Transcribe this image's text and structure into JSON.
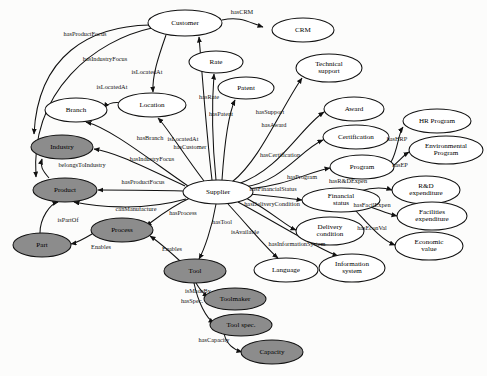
{
  "diagram": {
    "type": "ontology-graph",
    "colors": {
      "node_fill_light": "#ffffff",
      "node_fill_dark": "#8c8c8c",
      "stroke": "#111111",
      "background": "#fcfcfb",
      "label": "#000000"
    },
    "nodes": [
      {
        "id": "customer",
        "label": "Customer",
        "x": 185,
        "y": 23,
        "rx": 37,
        "ry": 13,
        "shade": "light"
      },
      {
        "id": "crm",
        "label": "CRM",
        "x": 303,
        "y": 30,
        "rx": 31,
        "ry": 12,
        "shade": "light"
      },
      {
        "id": "rate",
        "label": "Rate",
        "x": 216,
        "y": 62,
        "rx": 27,
        "ry": 11,
        "shade": "light"
      },
      {
        "id": "technical-support",
        "label": "Technical support",
        "x": 329,
        "y": 68,
        "rx": 33,
        "ry": 14,
        "shade": "light"
      },
      {
        "id": "patent",
        "label": "Patent",
        "x": 246,
        "y": 88,
        "rx": 28,
        "ry": 11,
        "shade": "light"
      },
      {
        "id": "location",
        "label": "Location",
        "x": 152,
        "y": 105,
        "rx": 34,
        "ry": 12,
        "shade": "light"
      },
      {
        "id": "branch",
        "label": "Branch",
        "x": 76,
        "y": 110,
        "rx": 31,
        "ry": 12,
        "shade": "light"
      },
      {
        "id": "award",
        "label": "Award",
        "x": 354,
        "y": 109,
        "rx": 30,
        "ry": 12,
        "shade": "light"
      },
      {
        "id": "hr-program",
        "label": "HR Program",
        "x": 437,
        "y": 121,
        "rx": 34,
        "ry": 12,
        "shade": "light"
      },
      {
        "id": "certification",
        "label": "Certification",
        "x": 356,
        "y": 137,
        "rx": 33,
        "ry": 12,
        "shade": "light"
      },
      {
        "id": "industry",
        "label": "Industry",
        "x": 62,
        "y": 147,
        "rx": 31,
        "ry": 12,
        "shade": "dark"
      },
      {
        "id": "environmental-program",
        "label": "Environmental Program",
        "x": 446,
        "y": 150,
        "rx": 37,
        "ry": 14,
        "shade": "light"
      },
      {
        "id": "program",
        "label": "Program",
        "x": 362,
        "y": 167,
        "rx": 32,
        "ry": 12,
        "shade": "light"
      },
      {
        "id": "product",
        "label": "Product",
        "x": 65,
        "y": 190,
        "rx": 32,
        "ry": 12,
        "shade": "dark"
      },
      {
        "id": "rd-expenditure",
        "label": "R&D expenditure",
        "x": 426,
        "y": 190,
        "rx": 34,
        "ry": 14,
        "shade": "light"
      },
      {
        "id": "financial-status",
        "label": "Financial status",
        "x": 341,
        "y": 200,
        "rx": 39,
        "ry": 12,
        "shade": "light"
      },
      {
        "id": "supplier",
        "label": "Supplier",
        "x": 218,
        "y": 192,
        "rx": 35,
        "ry": 12,
        "shade": "light"
      },
      {
        "id": "facilities-expenditure",
        "label": "Facilities expenditure",
        "x": 432,
        "y": 216,
        "rx": 35,
        "ry": 14,
        "shade": "light"
      },
      {
        "id": "process",
        "label": "Process",
        "x": 122,
        "y": 230,
        "rx": 31,
        "ry": 12,
        "shade": "dark"
      },
      {
        "id": "delivery-condition",
        "label": "Delivery condition",
        "x": 330,
        "y": 231,
        "rx": 34,
        "ry": 14,
        "shade": "light"
      },
      {
        "id": "economic-value",
        "label": "Economic value",
        "x": 429,
        "y": 246,
        "rx": 34,
        "ry": 14,
        "shade": "light"
      },
      {
        "id": "part",
        "label": "Part",
        "x": 42,
        "y": 245,
        "rx": 29,
        "ry": 12,
        "shade": "dark"
      },
      {
        "id": "language",
        "label": "Language",
        "x": 286,
        "y": 270,
        "rx": 32,
        "ry": 12,
        "shade": "light"
      },
      {
        "id": "information-system",
        "label": "Information system",
        "x": 352,
        "y": 268,
        "rx": 33,
        "ry": 14,
        "shade": "light"
      },
      {
        "id": "tool",
        "label": "Tool",
        "x": 195,
        "y": 271,
        "rx": 31,
        "ry": 12,
        "shade": "dark"
      },
      {
        "id": "toolmaker",
        "label": "Toolmaker",
        "x": 235,
        "y": 299,
        "rx": 31,
        "ry": 11,
        "shade": "dark"
      },
      {
        "id": "tool-spec",
        "label": "Tool spec.",
        "x": 241,
        "y": 325,
        "rx": 31,
        "ry": 11,
        "shade": "dark"
      },
      {
        "id": "capacity",
        "label": "Capacity",
        "x": 272,
        "y": 352,
        "rx": 31,
        "ry": 12,
        "shade": "dark"
      }
    ],
    "edges": [
      {
        "id": "e-hascrm",
        "label": "hasCRM",
        "from": "customer",
        "to": "crm",
        "path": "M 222 20 C 240 16 248 22 263 27",
        "label_x": 242,
        "label_y": 13
      },
      {
        "id": "e-hasproductfocus-cust",
        "label": "hasProductFocus",
        "from": "customer",
        "to": "industry",
        "path": "M 150 25 C 90 26 38 55 34 134",
        "label_x": 85,
        "label_y": 35
      },
      {
        "id": "e-hasindustryfocus-cust",
        "label": "hasIndustryFocus",
        "from": "customer",
        "to": "product",
        "path": "M 152 28 C 96 40 30 90 36 177",
        "label_x": 105,
        "label_y": 60
      },
      {
        "id": "e-islocatedat-cust",
        "label": "isLocatedAt",
        "from": "customer",
        "to": "location",
        "path": "M 166 35 C 158 58 152 76 153 92",
        "label_x": 147,
        "label_y": 73
      },
      {
        "id": "e-islocatedat-branch",
        "label": "isLocatedAt",
        "from": "location",
        "to": "branch",
        "path": "M 122 103 C 112 101 106 105 104 108",
        "label_x": 112,
        "label_y": 88
      },
      {
        "id": "e-hasbranch",
        "label": "hasBranch",
        "from": "supplier",
        "to": "branch",
        "path": "M 188 186 C 150 160 110 128 86 122",
        "label_x": 150,
        "label_y": 139
      },
      {
        "id": "e-hasindustryfocus-sup",
        "label": "hasIndustryFocus",
        "from": "supplier",
        "to": "industry",
        "path": "M 185 186 C 150 170 116 152 94 149",
        "label_x": 152,
        "label_y": 160
      },
      {
        "id": "e-hasproductfocus-sup",
        "label": "hasProductFocus",
        "from": "supplier",
        "to": "product",
        "path": "M 183 191 C 150 190 120 190 98 190",
        "label_x": 143,
        "label_y": 183
      },
      {
        "id": "e-belongstoindustry",
        "label": "belongsToIndustry",
        "from": "product",
        "to": "industry",
        "path": "M 49 178 C 42 170 40 166 42 159",
        "label_x": 82,
        "label_y": 166
      },
      {
        "id": "e-islocatedat-sup",
        "label": "isLocatedAt",
        "from": "supplier",
        "to": "location",
        "path": "M 204 181 C 184 155 166 126 158 118",
        "label_x": 183,
        "label_y": 140
      },
      {
        "id": "e-hascustomer",
        "label": "hasCustomer",
        "from": "supplier",
        "to": "customer",
        "path": "M 212 180 C 206 130 202 70 199 37",
        "label_x": 190,
        "label_y": 148
      },
      {
        "id": "e-hasrate",
        "label": "hasRate",
        "from": "supplier",
        "to": "rate",
        "path": "M 216 180 C 212 140 212 100 214 74",
        "label_x": 209,
        "label_y": 98
      },
      {
        "id": "e-haspatent",
        "label": "hasPatent",
        "from": "supplier",
        "to": "patent",
        "path": "M 222 180 C 224 150 228 115 235 100",
        "label_x": 221,
        "label_y": 115
      },
      {
        "id": "e-hassupport",
        "label": "hasSupport",
        "from": "supplier",
        "to": "technical-support",
        "path": "M 232 182 C 260 160 280 110 302 78",
        "label_x": 270,
        "label_y": 113
      },
      {
        "id": "e-hasaward",
        "label": "hasAward",
        "from": "supplier",
        "to": "award",
        "path": "M 238 184 C 280 170 300 128 324 112",
        "label_x": 274,
        "label_y": 126
      },
      {
        "id": "e-hascertification",
        "label": "hasCertification",
        "from": "supplier",
        "to": "certification",
        "path": "M 244 187 C 282 182 300 150 323 140",
        "label_x": 280,
        "label_y": 156
      },
      {
        "id": "e-hasprogram",
        "label": "hasProgram",
        "from": "supplier",
        "to": "program",
        "path": "M 248 189 C 286 186 308 172 330 168",
        "label_x": 302,
        "label_y": 178
      },
      {
        "id": "e-hashrp",
        "label": "hasHRP",
        "from": "program",
        "to": "hr-program",
        "path": "M 391 162 C 398 150 398 134 403 127",
        "label_x": 397,
        "label_y": 140
      },
      {
        "id": "e-hasep",
        "label": "hasEP",
        "from": "program",
        "to": "environmental-program",
        "path": "M 393 166 C 400 160 404 155 409 152",
        "label_x": 400,
        "label_y": 166
      },
      {
        "id": "e-hasfinancialstatus",
        "label": "hasFinancialStatus",
        "from": "supplier",
        "to": "financial-status",
        "path": "M 249 194 C 275 196 290 199 302 200",
        "label_x": 273,
        "label_y": 190
      },
      {
        "id": "e-hasrdexpen",
        "label": "hasR&DExpen",
        "from": "financial-status",
        "to": "rd-expenditure",
        "path": "M 360 191 C 376 186 386 188 392 190",
        "label_x": 348,
        "label_y": 182
      },
      {
        "id": "e-hasfacilexpen",
        "label": "hasFacilExpen",
        "from": "financial-status",
        "to": "facilities-expenditure",
        "path": "M 368 206 C 382 211 388 214 397 216",
        "label_x": 372,
        "label_y": 206
      },
      {
        "id": "e-haseconval",
        "label": "hasEconVal",
        "from": "financial-status",
        "to": "economic-value",
        "path": "M 356 211 C 370 226 382 240 395 245",
        "label_x": 372,
        "label_y": 229
      },
      {
        "id": "e-hasdeliverycondition",
        "label": "hasDeliveryCondition",
        "from": "supplier",
        "to": "delivery-condition",
        "path": "M 246 198 C 272 212 286 226 296 230",
        "label_x": 272,
        "label_y": 205
      },
      {
        "id": "e-hasinformationsystem",
        "label": "hasInformationSystem",
        "from": "supplier",
        "to": "information-system",
        "path": "M 238 202 C 282 226 320 250 338 256",
        "label_x": 297,
        "label_y": 245
      },
      {
        "id": "e-isavailable",
        "label": "isAvailable",
        "from": "supplier",
        "to": "language",
        "path": "M 228 204 C 250 228 268 250 278 258",
        "label_x": 245,
        "label_y": 233
      },
      {
        "id": "e-hastool",
        "label": "hasTool",
        "from": "supplier",
        "to": "tool",
        "path": "M 216 204 C 212 228 204 250 199 259",
        "label_x": 222,
        "label_y": 223
      },
      {
        "id": "e-hasprocess",
        "label": "hasProcess",
        "from": "supplier",
        "to": "process",
        "path": "M 190 198 C 168 208 152 222 146 226",
        "label_x": 183,
        "label_y": 214
      },
      {
        "id": "e-canmanufacture",
        "label": "canManufacture",
        "from": "supplier",
        "to": "product",
        "path": "M 186 199 C 140 212 94 206 74 202",
        "label_x": 136,
        "label_y": 210
      },
      {
        "id": "e-ispartof",
        "label": "isPartOf",
        "from": "part",
        "to": "product",
        "path": "M 40 233 C 40 218 50 204 58 202",
        "label_x": 68,
        "label_y": 221
      },
      {
        "id": "e-enables-part",
        "label": "Enables",
        "from": "process",
        "to": "part",
        "path": "M 92 234 C 82 240 76 243 71 244",
        "label_x": 101,
        "label_y": 248
      },
      {
        "id": "e-enables-tool",
        "label": "Enables",
        "from": "tool",
        "to": "process",
        "path": "M 180 261 C 168 250 156 240 150 236",
        "label_x": 172,
        "label_y": 250
      },
      {
        "id": "e-ismadeby",
        "label": "isMadeBy",
        "from": "tool",
        "to": "toolmaker",
        "path": "M 196 283 C 200 290 204 294 208 297",
        "label_x": 198,
        "label_y": 292
      },
      {
        "id": "e-hasspec",
        "label": "hasSpec.",
        "from": "tool",
        "to": "tool-spec",
        "path": "M 194 283 C 198 302 206 318 214 323",
        "label_x": 192,
        "label_y": 302
      },
      {
        "id": "e-hascapacity",
        "label": "hasCapacity",
        "from": "tool-spec",
        "to": "capacity",
        "path": "M 224 333 C 226 344 234 350 242 352",
        "label_x": 214,
        "label_y": 341
      }
    ]
  }
}
